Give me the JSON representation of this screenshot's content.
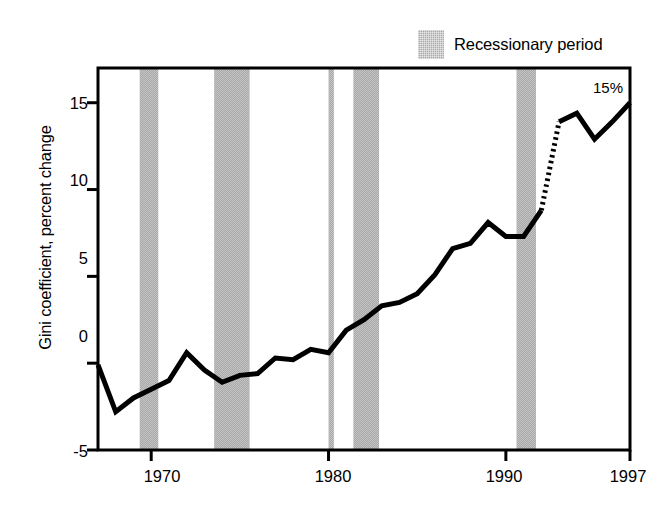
{
  "chart_data": {
    "type": "line",
    "title": "",
    "subtitle": "",
    "xlabel": "",
    "ylabel": "Gini coefficient, percent change",
    "xlim": [
      1967,
      1997
    ],
    "ylim": [
      -5,
      17
    ],
    "grid": false,
    "y_ticks": [
      15,
      10,
      5,
      0,
      -5
    ],
    "y_tick_labels": [
      "15",
      "10",
      "5",
      "0",
      "-5"
    ],
    "x_ticks": [
      1970,
      1980,
      1990,
      1997
    ],
    "x_tick_labels": [
      "1970",
      "1980",
      "1990",
      "1997"
    ],
    "legend": {
      "position": "top-right-outside",
      "entries": [
        {
          "label": "Recessionary period",
          "swatch": "shaded-band",
          "color": "#a9a9a9"
        }
      ]
    },
    "annotations": [
      {
        "text": "15%",
        "x": 1996.4,
        "y": 15.6,
        "note": "endpoint value label"
      }
    ],
    "series": [
      {
        "name": "Gini coefficient, percent change",
        "style": "solid",
        "color": "#000000",
        "x": [
          1967,
          1968,
          1969,
          1970,
          1971,
          1972,
          1973,
          1974,
          1975,
          1976,
          1977,
          1978,
          1979,
          1980,
          1981,
          1982,
          1983,
          1984,
          1985,
          1986,
          1987,
          1988,
          1989,
          1990,
          1991,
          1992
        ],
        "y": [
          -0.1,
          -2.8,
          -2.0,
          -1.5,
          -1.0,
          0.6,
          -0.4,
          -1.1,
          -0.7,
          -0.6,
          0.3,
          0.2,
          0.8,
          0.6,
          1.9,
          2.5,
          3.3,
          3.5,
          4.0,
          5.1,
          6.6,
          6.9,
          8.1,
          7.3,
          7.3,
          8.8
        ]
      },
      {
        "name": "Gini coefficient, percent change (break in series)",
        "style": "dotted",
        "color": "#000000",
        "x": [
          1992,
          1993
        ],
        "y": [
          8.8,
          13.9
        ]
      },
      {
        "name": "Gini coefficient, percent change (revised methodology)",
        "style": "solid",
        "color": "#000000",
        "x": [
          1993,
          1994,
          1995,
          1996,
          1997
        ],
        "y": [
          13.9,
          14.4,
          12.9,
          13.9,
          15.0
        ]
      }
    ],
    "shaded_regions": [
      {
        "label": "Recessionary period",
        "x_start": 1969.35,
        "x_end": 1970.4,
        "color": "#a9a9a9"
      },
      {
        "label": "Recessionary period",
        "x_start": 1973.55,
        "x_end": 1975.55,
        "color": "#a9a9a9"
      },
      {
        "label": "Recessionary period",
        "x_start": 1980.0,
        "x_end": 1980.3,
        "color": "#a9a9a9"
      },
      {
        "label": "Recessionary period",
        "x_start": 1981.4,
        "x_end": 1982.85,
        "color": "#a9a9a9"
      },
      {
        "label": "Recessionary period",
        "x_start": 1990.6,
        "x_end": 1991.7,
        "color": "#a9a9a9"
      }
    ]
  },
  "legend": {
    "recession_label": "Recessionary period"
  },
  "axes": {
    "y_title": "Gini coefficient, percent change",
    "y_tick_labels": [
      "15",
      "10",
      "5",
      "0",
      "-5"
    ],
    "x_tick_labels": [
      "1970",
      "1980",
      "1990",
      "1997"
    ]
  },
  "annotation": {
    "endpoint": "15%"
  },
  "colors": {
    "line": "#000000",
    "band": "#a9a9a9",
    "frame": "#000000",
    "background": "#ffffff"
  }
}
